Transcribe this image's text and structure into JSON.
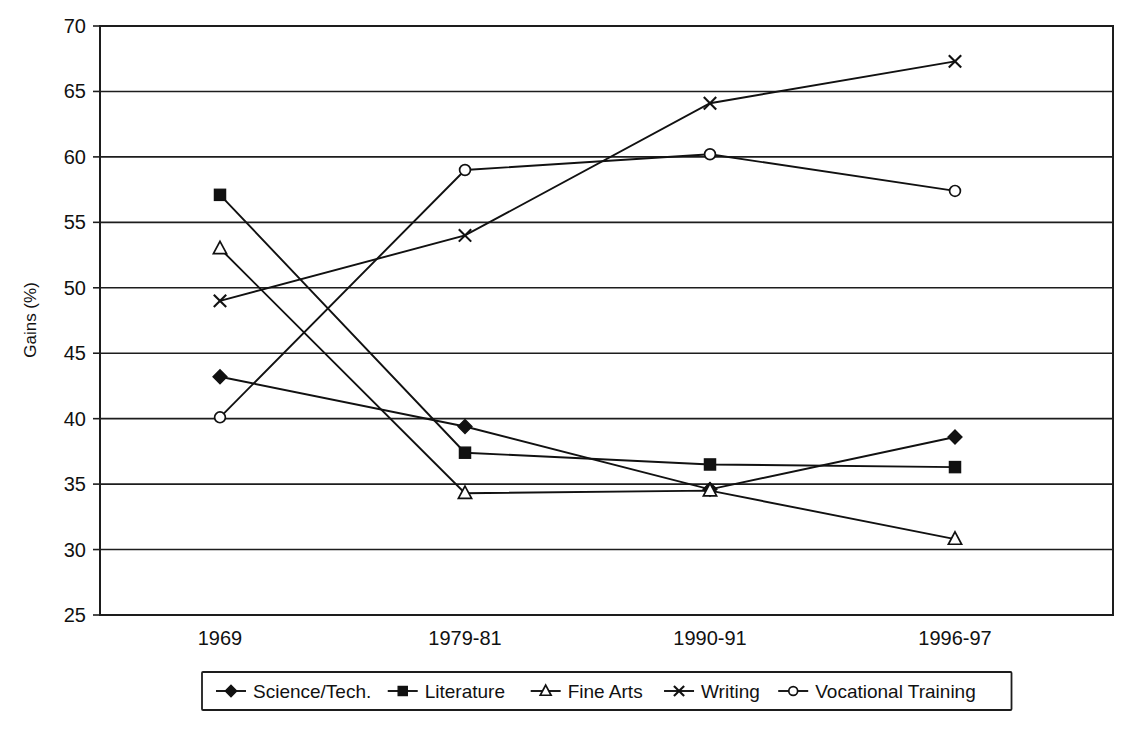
{
  "chart_data": {
    "type": "line",
    "title": "",
    "xlabel": "",
    "ylabel": "Gains (%)",
    "ylim": [
      25,
      70
    ],
    "ytick_step": 5,
    "yticks": [
      25,
      30,
      35,
      40,
      45,
      50,
      55,
      60,
      65,
      70
    ],
    "categories": [
      "1969",
      "1979-81",
      "1990-91",
      "1996-97"
    ],
    "grid": "horizontal",
    "legend_position": "bottom",
    "series": [
      {
        "name": "Science/Tech.",
        "marker": "filled-diamond",
        "values": [
          43.2,
          39.4,
          34.6,
          38.6
        ]
      },
      {
        "name": "Literature",
        "marker": "filled-square",
        "values": [
          57.1,
          37.4,
          36.5,
          36.3
        ]
      },
      {
        "name": "Fine Arts",
        "marker": "open-triangle",
        "values": [
          53.0,
          34.3,
          34.5,
          30.8
        ]
      },
      {
        "name": "Writing",
        "marker": "cross",
        "values": [
          49.0,
          54.0,
          64.1,
          67.3
        ]
      },
      {
        "name": "Vocational Training",
        "marker": "open-circle",
        "values": [
          40.1,
          59.0,
          60.2,
          57.4
        ]
      }
    ],
    "colors": {
      "line": "#111111",
      "grid": "#1d1d1d",
      "background": "#ffffff"
    }
  },
  "yaxis": {
    "label": "Gains (%)",
    "tick_labels": [
      "70",
      "65",
      "60",
      "55",
      "50",
      "45",
      "40",
      "35",
      "30",
      "25"
    ]
  },
  "xaxis": {
    "tick_labels": [
      "1969",
      "1979-81",
      "1990-91",
      "1996-97"
    ]
  },
  "legend": {
    "items": [
      {
        "label": "Science/Tech.",
        "marker": "filled-diamond"
      },
      {
        "label": "Literature",
        "marker": "filled-square"
      },
      {
        "label": "Fine Arts",
        "marker": "open-triangle"
      },
      {
        "label": "Writing",
        "marker": "cross"
      },
      {
        "label": "Vocational Training",
        "marker": "open-circle"
      }
    ]
  }
}
